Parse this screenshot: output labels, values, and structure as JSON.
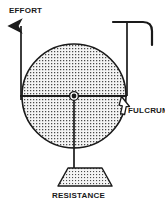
{
  "figure": {
    "background_color": "#ffffff",
    "line_color": "#1a1a1a",
    "fill_pattern_color": "#555555",
    "fill_background_color": "#f2f2f2"
  },
  "labels": {
    "effort": "EFFORT",
    "fulcrum": "FULCRUM",
    "resistance": "RESISTANCE"
  },
  "parts": {
    "wheel": {
      "name": "wheel",
      "center_x": 74,
      "center_y": 96,
      "radius": 52,
      "fill": "stippled"
    },
    "hub": {
      "name": "axle-hub",
      "center_x": 74,
      "center_y": 96,
      "radius": 4
    },
    "axle_line": {
      "name": "horizontal-axle",
      "x1": 20,
      "y1": 96,
      "x2": 127,
      "y2": 96
    },
    "effort_arrow": {
      "name": "effort-arrow",
      "x": 21,
      "y_top": 22,
      "y_bottom": 100,
      "direction": "up"
    },
    "fulcrum_arrow": {
      "name": "fulcrum-arrow",
      "tip_x": 121,
      "tip_y": 97,
      "direction": "up-left"
    },
    "bracket": {
      "name": "support-bracket",
      "top_y": 22,
      "left_x": 113,
      "right_x": 152,
      "vertical_x": 127,
      "hook_bottom_y": 45
    },
    "resistance_rod": {
      "name": "resistance-rod",
      "x": 74,
      "y_top": 96,
      "y_bottom": 168
    },
    "weight": {
      "name": "resistance-weight",
      "shape": "trapezoid",
      "top_left_x": 68,
      "top_right_x": 102,
      "top_y": 168,
      "bottom_left_x": 58,
      "bottom_right_x": 112,
      "bottom_y": 186
    }
  }
}
